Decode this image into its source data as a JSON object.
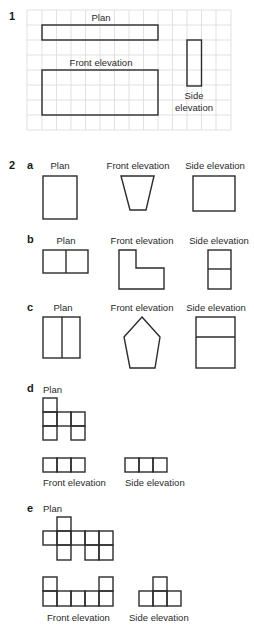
{
  "q1": {
    "number": "1",
    "labels": {
      "plan": "Plan",
      "front": "Front elevation",
      "side_1": "Side",
      "side_2": "elevation"
    }
  },
  "q2": {
    "number": "2",
    "parts": {
      "a": {
        "letter": "a",
        "plan": "Plan",
        "front": "Front elevation",
        "side": "Side elevation"
      },
      "b": {
        "letter": "b",
        "plan": "Plan",
        "front": "Front elevation",
        "side": "Side elevation"
      },
      "c": {
        "letter": "c",
        "plan": "Plan",
        "front": "Front elevation",
        "side": "Side elevation"
      },
      "d": {
        "letter": "d",
        "plan": "Plan",
        "front": "Front elevation",
        "side": "Side elevation"
      },
      "e": {
        "letter": "e",
        "plan": "Plan",
        "front": "Front elevation",
        "side": "Side elevation"
      }
    }
  },
  "colors": {
    "grid": "#d9d9d9",
    "stroke": "#2b2b2b",
    "background": "#ffffff"
  }
}
